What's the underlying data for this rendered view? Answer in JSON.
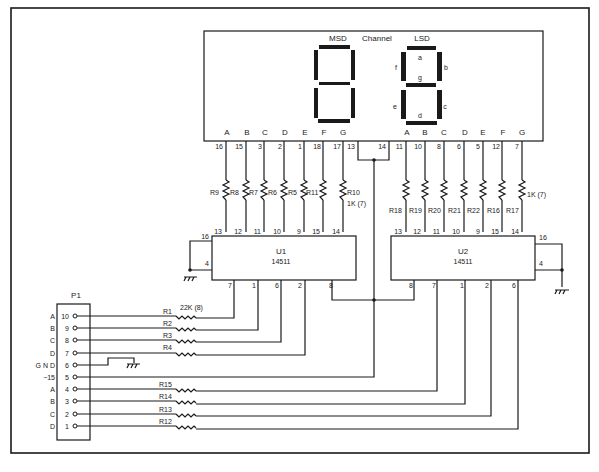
{
  "display": {
    "msd_label": "MSD",
    "channel_label": "Channel",
    "lsd_label": "LSD",
    "segment_letters": {
      "a": "a",
      "b": "b",
      "c": "c",
      "d": "d",
      "e": "e",
      "f": "f",
      "g": "g"
    },
    "msd_pins": [
      {
        "segment": "A",
        "pin": "16"
      },
      {
        "segment": "B",
        "pin": "15"
      },
      {
        "segment": "C",
        "pin": "3"
      },
      {
        "segment": "D",
        "pin": "2"
      },
      {
        "segment": "E",
        "pin": "1"
      },
      {
        "segment": "F",
        "pin": "18"
      },
      {
        "segment": "G",
        "pin": "17"
      }
    ],
    "common_pins": [
      "13",
      "14"
    ],
    "lsd_pins": [
      {
        "segment": "A",
        "pin": "11"
      },
      {
        "segment": "B",
        "pin": "10"
      },
      {
        "segment": "C",
        "pin": "8"
      },
      {
        "segment": "D",
        "pin": "6"
      },
      {
        "segment": "E",
        "pin": "5"
      },
      {
        "segment": "F",
        "pin": "12"
      },
      {
        "segment": "G",
        "pin": "7"
      }
    ]
  },
  "resistors_msd": [
    "R9",
    "R8",
    "R7",
    "R6",
    "R5",
    "R11",
    "R10"
  ],
  "resistors_msd_value": "1K (7)",
  "resistors_lsd": [
    "R18",
    "R19",
    "R20",
    "R21",
    "R22",
    "R16",
    "R17"
  ],
  "resistors_lsd_value": "1K (7)",
  "u1": {
    "name": "U1",
    "part": "14511",
    "top_pins": [
      "13",
      "12",
      "11",
      "10",
      "9",
      "15",
      "14"
    ],
    "left_pins": [
      "16",
      "4"
    ],
    "bottom_pins": [
      "7",
      "1",
      "6",
      "2",
      "8"
    ]
  },
  "u2": {
    "name": "U2",
    "part": "14511",
    "top_pins": [
      "13",
      "12",
      "11",
      "10",
      "9",
      "15",
      "14"
    ],
    "right_pins": [
      "16",
      "4"
    ],
    "bottom_pins": [
      "8",
      "7",
      "1",
      "2",
      "6"
    ]
  },
  "p1": {
    "name": "P1",
    "rows": [
      {
        "label": "A",
        "pin": "10"
      },
      {
        "label": "B",
        "pin": "9"
      },
      {
        "label": "C",
        "pin": "8"
      },
      {
        "label": "D",
        "pin": "7"
      },
      {
        "label": "G N D",
        "pin": "6"
      },
      {
        "label": "−15",
        "pin": "5"
      },
      {
        "label": "A",
        "pin": "4"
      },
      {
        "label": "B",
        "pin": "3"
      },
      {
        "label": "C",
        "pin": "2"
      },
      {
        "label": "D",
        "pin": "1"
      }
    ]
  },
  "input_resistors": {
    "upper": [
      "R1",
      "R2",
      "R3",
      "R4"
    ],
    "upper_value": "22K (8)",
    "lower": [
      "R15",
      "R14",
      "R13",
      "R12"
    ]
  },
  "colors": {
    "ink": "#1a1a1a",
    "paper": "#ffffff"
  }
}
